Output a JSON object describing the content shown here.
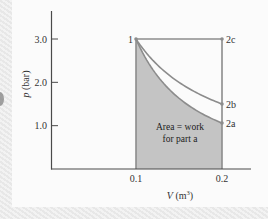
{
  "chart_data": {
    "type": "line",
    "title": "",
    "xlabel": "V (m³)",
    "ylabel": "p (bar)",
    "xlim": [
      0,
      0.23
    ],
    "ylim": [
      0,
      3.6
    ],
    "grid": false,
    "legend": "none",
    "x_ticks": [
      {
        "value": 0.1,
        "label": "0.1"
      },
      {
        "value": 0.2,
        "label": "0.2"
      }
    ],
    "y_ticks": [
      {
        "value": 1.0,
        "label": "1.0"
      },
      {
        "value": 2.0,
        "label": "2.0"
      },
      {
        "value": 3.0,
        "label": "3.0"
      }
    ],
    "points": [
      {
        "name": "1",
        "V": 0.1,
        "p": 3.0
      },
      {
        "name": "2a",
        "V": 0.2,
        "p": 1.06
      },
      {
        "name": "2b",
        "V": 0.2,
        "p": 1.5
      },
      {
        "name": "2c",
        "V": 0.2,
        "p": 3.0
      }
    ],
    "series": [
      {
        "name": "Process 1-2a (pV^1.5 = const)",
        "n": 1.5,
        "from": "1",
        "to": "2a",
        "shaded": true
      },
      {
        "name": "Process 1-2b (pV = const)",
        "n": 1.0,
        "from": "1",
        "to": "2b"
      },
      {
        "name": "Process 1-2c (p = const)",
        "n": 0,
        "from": "1",
        "to": "2c"
      }
    ],
    "annotations": [
      {
        "text": "Area = work",
        "line": 1
      },
      {
        "text": "for part a",
        "line": 2
      }
    ]
  },
  "labels": {
    "ylabel_italic": "p",
    "ylabel_unit": " (bar)",
    "xlabel_italic": "V",
    "xlabel_unit": " (m",
    "xlabel_sup": "3",
    "xlabel_close": ")",
    "area_line1": "Area = work",
    "area_line2": "for part a"
  },
  "colors": {
    "fill": "#c4c4c4",
    "curve": "#8c8c8c",
    "axis": "#4a4a4a"
  }
}
